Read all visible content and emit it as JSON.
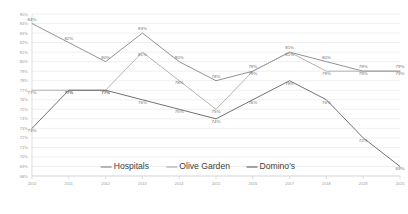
{
  "chart_data": {
    "type": "line",
    "title": "",
    "xlabel": "",
    "ylabel": "",
    "categories": [
      "2010",
      "2011",
      "2012",
      "2013",
      "2014",
      "2015",
      "2016",
      "2017",
      "2018",
      "2019",
      "2020"
    ],
    "ylim": [
      68,
      85
    ],
    "yticks": [
      "85%",
      "84%",
      "83%",
      "82%",
      "81%",
      "80%",
      "79%",
      "78%",
      "77%",
      "76%",
      "75%",
      "74%",
      "73%",
      "72%",
      "71%",
      "70%",
      "69%",
      "68%"
    ],
    "ytick_values": [
      85,
      84,
      83,
      82,
      81,
      80,
      79,
      78,
      77,
      76,
      75,
      74,
      73,
      72,
      71,
      70,
      69,
      68
    ],
    "grid": true,
    "legend_position": "bottom",
    "series": [
      {
        "name": "Hospitals",
        "color": "#7f7f7f",
        "values": [
          84,
          82,
          80,
          83,
          80,
          78,
          79,
          81,
          80,
          79,
          79
        ],
        "labels": [
          "84%",
          "82%",
          "80%",
          "83%",
          "80%",
          "78%",
          "79%",
          "81%",
          "80%",
          "79%",
          "79%"
        ]
      },
      {
        "name": "Olive Garden",
        "color": "#a6a6a6",
        "values": [
          77,
          77,
          77,
          81,
          78,
          75,
          79,
          81,
          79,
          79,
          79
        ],
        "labels": [
          "77%",
          "77%",
          "77%",
          "81%",
          "78%",
          "75%",
          "79%",
          "81%",
          "79%",
          "79%",
          "79%"
        ]
      },
      {
        "name": "Domino's",
        "color": "#595959",
        "values": [
          73,
          77,
          77,
          76,
          75,
          74,
          76,
          78,
          76,
          72,
          69
        ],
        "labels": [
          "73%",
          "77%",
          "77%",
          "76%",
          "75%",
          "74%",
          "76%",
          "78%",
          "76%",
          "72%",
          "69%"
        ]
      }
    ]
  },
  "legend": {
    "items": [
      {
        "label": "Hospitals",
        "color": "#7f7f7f"
      },
      {
        "label": "Olive Garden",
        "color": "#a6a6a6"
      },
      {
        "label": "Domino's",
        "color": "#595959"
      }
    ]
  }
}
